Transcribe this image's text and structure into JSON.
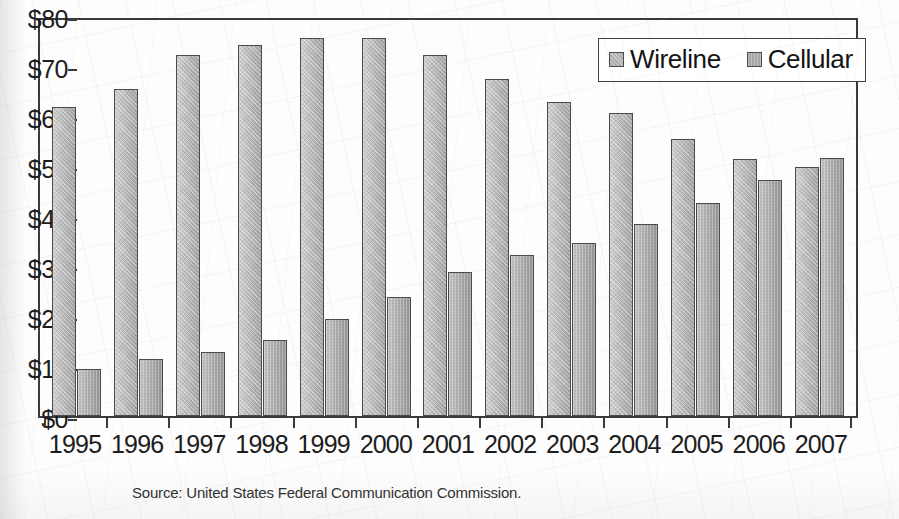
{
  "chart_data": {
    "type": "bar",
    "title": "",
    "subtitle": "",
    "xlabel": "",
    "ylabel": "",
    "categories": [
      "1995",
      "1996",
      "1997",
      "1998",
      "1999",
      "2000",
      "2001",
      "2002",
      "2003",
      "2004",
      "2005",
      "2006",
      "2007"
    ],
    "series": [
      {
        "name": "Wireline",
        "color": "#b4b4b4",
        "values": [
          61.9,
          65.5,
          72.3,
          74.3,
          75.6,
          75.6,
          72.3,
          67.5,
          62.8,
          60.6,
          55.4,
          51.4,
          49.9
        ]
      },
      {
        "name": "Cellular",
        "color": "#a8a8a8",
        "values": [
          9.4,
          11.4,
          12.9,
          15.3,
          19.4,
          23.9,
          28.9,
          32.3,
          34.6,
          38.4,
          42.6,
          47.3,
          51.7
        ]
      }
    ],
    "ylim": [
      0,
      80
    ],
    "ytick_values": [
      0,
      10,
      20,
      30,
      40,
      50,
      60,
      70,
      80
    ],
    "ytick_labels": [
      "$0",
      "$10",
      "$20",
      "$30",
      "$40",
      "$50",
      "$60",
      "$70",
      "$80"
    ],
    "grid": false,
    "legend_position": "top-right",
    "legend_entries": [
      "Wireline",
      "Cellular"
    ],
    "annotations": [
      "Source: United States Federal Communication Commission."
    ]
  },
  "legend": {
    "wireline_label": "Wireline",
    "cellular_label": "Cellular"
  },
  "caption": {
    "source": "Source: United States Federal Communication Commission."
  }
}
